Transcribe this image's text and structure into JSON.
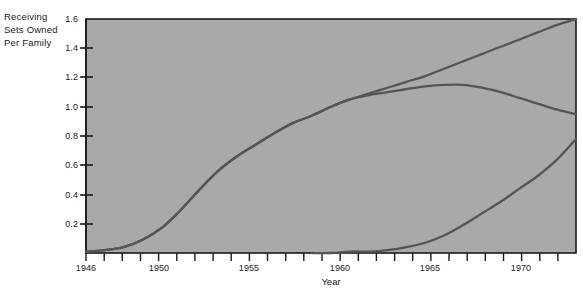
{
  "chart_data": {
    "type": "line",
    "title": "",
    "ylabel": "Receiving Sets Owned Per Family",
    "ylabel_lines": [
      "Receiving",
      "Sets Owned",
      "Per Family"
    ],
    "xlabel": "Year",
    "xlim": [
      1946,
      1972
    ],
    "ylim": [
      0,
      1.6
    ],
    "grid": false,
    "legend_position": "inline-annotations",
    "ytick_labels": [
      "0.2",
      "0.4",
      "0.6",
      "0.8",
      "1.0",
      "1.2",
      "1.4",
      "1.6"
    ],
    "ytick_values": [
      0.2,
      0.4,
      0.6,
      0.8,
      1.0,
      1.2,
      1.4,
      1.6
    ],
    "xtick_labels": [
      "1946",
      "1950",
      "1955",
      "1960",
      "1965",
      "1970"
    ],
    "xtick_values": [
      1946,
      1950,
      1955,
      1960,
      1965,
      1970
    ],
    "xtick_minor_step": 1,
    "series": [
      {
        "name": "Total sets",
        "label": "Total sets",
        "x": [
          1946,
          1947,
          1948,
          1949,
          1950,
          1951,
          1952,
          1953,
          1954,
          1955,
          1956,
          1957,
          1958,
          1959,
          1960,
          1961,
          1962,
          1963,
          1964,
          1965,
          1966,
          1967,
          1968,
          1969,
          1970,
          1971,
          1972
        ],
        "values": [
          0.01,
          0.02,
          0.04,
          0.09,
          0.17,
          0.29,
          0.43,
          0.56,
          0.66,
          0.74,
          0.82,
          0.89,
          0.94,
          1.0,
          1.05,
          1.09,
          1.13,
          1.17,
          1.21,
          1.26,
          1.31,
          1.36,
          1.41,
          1.46,
          1.51,
          1.56,
          1.6
        ]
      },
      {
        "name": "Black-and-white sets",
        "label": "Black-and-white sets",
        "x": [
          1946,
          1947,
          1948,
          1949,
          1950,
          1951,
          1952,
          1953,
          1954,
          1955,
          1956,
          1957,
          1958,
          1959,
          1960,
          1961,
          1962,
          1963,
          1964,
          1965,
          1966,
          1967,
          1968,
          1969,
          1970,
          1971,
          1972
        ],
        "values": [
          0.01,
          0.02,
          0.04,
          0.09,
          0.17,
          0.29,
          0.43,
          0.56,
          0.66,
          0.74,
          0.82,
          0.89,
          0.94,
          1.0,
          1.05,
          1.08,
          1.1,
          1.12,
          1.14,
          1.15,
          1.15,
          1.13,
          1.1,
          1.06,
          1.02,
          0.98,
          0.95
        ]
      },
      {
        "name": "Color sets",
        "label": "Color sets",
        "x": [
          1958,
          1959,
          1960,
          1961,
          1962,
          1963,
          1964,
          1965,
          1966,
          1967,
          1968,
          1969,
          1970,
          1971,
          1972
        ],
        "values": [
          0.0,
          0.0,
          0.01,
          0.01,
          0.02,
          0.04,
          0.07,
          0.12,
          0.19,
          0.27,
          0.35,
          0.44,
          0.53,
          0.64,
          0.78
        ]
      }
    ],
    "annotations": [
      {
        "text": "Total sets",
        "near_year": 1962,
        "near_value": 1.32
      },
      {
        "text": "Black-and-white sets",
        "near_year": 1963,
        "near_value": 1.05
      },
      {
        "text": "Black-and-white sets",
        "near_year": 1954,
        "near_value": 0.62
      },
      {
        "text": "Color sets",
        "near_year": 1967,
        "near_value": 0.37
      }
    ],
    "colors": {
      "plot_background": "#a9a9a9",
      "line": "#555555",
      "axis": "#1a1a1a",
      "page_background": "#ffffff",
      "text": "#1a1a1a"
    }
  },
  "source_note": ""
}
